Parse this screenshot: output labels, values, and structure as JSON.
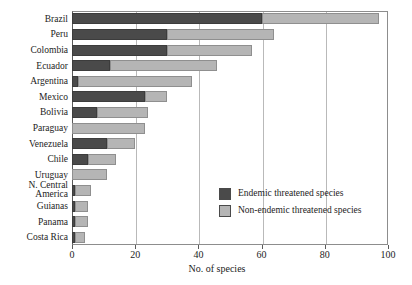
{
  "chart_data": {
    "type": "bar",
    "orientation": "horizontal",
    "stacked": true,
    "title": "",
    "xlabel": "No. of species",
    "ylabel": "",
    "xlim": [
      0,
      100
    ],
    "xticks": [
      0,
      20,
      40,
      60,
      80,
      100
    ],
    "grid": "vertical",
    "legend_position": "inside-right",
    "categories": [
      "Brazil",
      "Peru",
      "Colombia",
      "Ecuador",
      "Argentina",
      "Mexico",
      "Bolivia",
      "Paraguay",
      "Venezuela",
      "Chile",
      "Uruguay",
      "N. Central\nAmerica",
      "Guianas",
      "Panama",
      "Costa Rica"
    ],
    "series": [
      {
        "name": "Endemic threatened species",
        "color": "#4a4a4a",
        "values": [
          60,
          30,
          30,
          12,
          2,
          23,
          8,
          0,
          11,
          5,
          0,
          1,
          1,
          1,
          1
        ]
      },
      {
        "name": "Non-endemic threatened species",
        "color": "#b5b5b5",
        "values": [
          37,
          34,
          27,
          34,
          36,
          7,
          16,
          23,
          9,
          9,
          11,
          5,
          4,
          4,
          3
        ]
      }
    ],
    "totals": [
      97,
      64,
      57,
      46,
      38,
      30,
      24,
      23,
      20,
      14,
      11,
      6,
      5,
      5,
      4
    ]
  },
  "legend": {
    "items": [
      {
        "label": "Endemic threatened species",
        "color": "#4a4a4a"
      },
      {
        "label": "Non-endemic threatened species",
        "color": "#b5b5b5"
      }
    ]
  },
  "axis": {
    "x_title": "No. of species",
    "x_tick_labels": [
      "0",
      "20",
      "40",
      "60",
      "80",
      "100"
    ]
  }
}
